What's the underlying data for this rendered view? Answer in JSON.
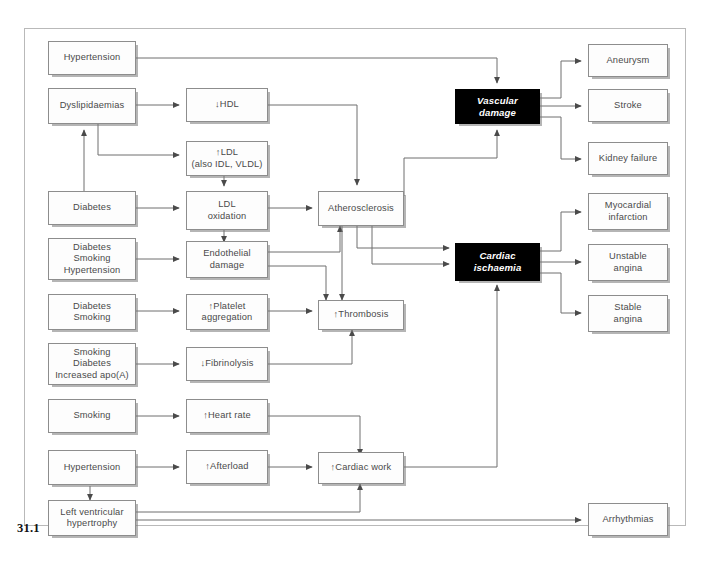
{
  "figure": {
    "number": "31.1"
  },
  "nodes": {
    "hypertension_top": {
      "label": "Hypertension"
    },
    "dyslipidaemias": {
      "label": "Dyslipidaemias"
    },
    "diabetes": {
      "label": "Diabetes"
    },
    "diabetes_smoking_hypertension": {
      "label": "Diabetes\nSmoking\nHypertension"
    },
    "diabetes_smoking": {
      "label": "Diabetes\nSmoking"
    },
    "smoking_diabetes_apo": {
      "label": "Smoking\nDiabetes\nIncreased apo(A)"
    },
    "smoking": {
      "label": "Smoking"
    },
    "hypertension_lower": {
      "label": "Hypertension"
    },
    "left_ventricular_hypertrophy": {
      "label": "Left ventricular\nhypertrophy"
    },
    "hdl_down": {
      "label": "↓HDL"
    },
    "ldl_up": {
      "label": "↑LDL\n(also IDL, VLDL)"
    },
    "ldl_oxidation": {
      "label": "LDL\noxidation"
    },
    "endothelial_damage": {
      "label": "Endothelial\ndamage"
    },
    "platelet_aggregation": {
      "label": "↑Platelet\naggregation"
    },
    "fibrinolysis_down": {
      "label": "↓Fibrinolysis"
    },
    "heart_rate_up": {
      "label": "↑Heart rate"
    },
    "afterload_up": {
      "label": "↑Afterload"
    },
    "atherosclerosis": {
      "label": "Atherosclerosis"
    },
    "thrombosis": {
      "label": "↑Thrombosis"
    },
    "cardiac_work": {
      "label": "↑Cardiac work"
    },
    "vascular_damage": {
      "label": "Vascular\ndamage",
      "style": "dark"
    },
    "cardiac_ischaemia": {
      "label": "Cardiac\nischaemia",
      "style": "dark"
    },
    "aneurysm": {
      "label": "Aneurysm"
    },
    "stroke": {
      "label": "Stroke"
    },
    "kidney_failure": {
      "label": "Kidney failure"
    },
    "myocardial_infarction": {
      "label": "Myocardial\ninfarction"
    },
    "unstable_angina": {
      "label": "Unstable\nangina"
    },
    "stable_angina": {
      "label": "Stable\nangina"
    },
    "arrhythmias": {
      "label": "Arrhythmias"
    }
  },
  "colors": {
    "frame_border": "#b9b9b9",
    "box_border": "#8d8d8d",
    "box_fill": "#fdfdfd",
    "box_text": "#4a4a4a",
    "dark_box_fill": "#000000",
    "dark_box_text": "#ffffff",
    "connector": "#6f6f6f",
    "label_text": "#111111"
  }
}
